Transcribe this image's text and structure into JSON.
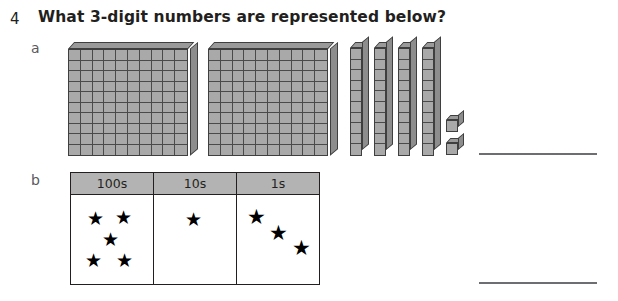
{
  "question": {
    "number": "4",
    "text": "What 3-digit numbers are represented below?"
  },
  "parts": [
    {
      "label": "a",
      "representation": "base-ten-blocks",
      "blocks": {
        "hundreds_flats": 2,
        "tens_rods": 4,
        "ones_units": 2
      },
      "value": "242",
      "answer_value": ""
    },
    {
      "label": "b",
      "representation": "place-value-table",
      "table": {
        "headers": [
          "100s",
          "10s",
          "1s"
        ],
        "counts": [
          5,
          1,
          3
        ],
        "symbol": "★"
      },
      "value": "513",
      "answer_value": ""
    }
  ],
  "colors": {
    "block_face": "#a9a9a9",
    "block_top": "#9a9a9a",
    "block_side": "#8d8d8d",
    "block_outline": "#3f3f3f",
    "table_header_fill": "#b3b3b3",
    "table_border": "#231f20",
    "answer_line": "#6d6e71",
    "text": "#231f20",
    "star": "#000000"
  }
}
